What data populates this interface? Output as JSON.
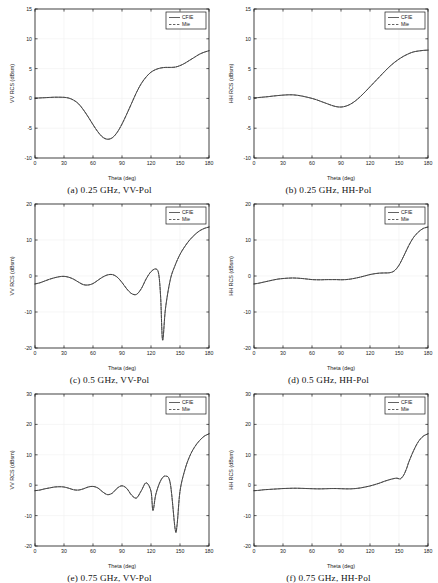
{
  "figure": {
    "panel_count": 6,
    "legend": {
      "entries": [
        "CFIE",
        "Mie"
      ],
      "position": "top-right"
    },
    "axis": {
      "xlabel": "Theta (deg)",
      "xticks": [
        0,
        30,
        60,
        90,
        120,
        150,
        180
      ],
      "xlim": [
        0,
        180
      ]
    },
    "colors": {
      "curve": "#3a3a3a",
      "axis": "#1a1a1a",
      "grid": "#f0f0f0",
      "background": "#ffffff"
    }
  },
  "chart_data": [
    {
      "id": "a",
      "type": "line",
      "caption": "(a)  0.25 GHz, VV-Pol",
      "frequency_ghz": 0.25,
      "polarization": "VV-Pol",
      "title": "",
      "xlabel": "Theta (deg)",
      "ylabel": "VV RCS (dBsm)",
      "xlim": [
        0,
        180
      ],
      "ylim": [
        -10,
        15
      ],
      "xticks": [
        0,
        30,
        60,
        90,
        120,
        150,
        180
      ],
      "yticks": [
        -10,
        -5,
        0,
        5,
        10,
        15
      ],
      "grid": true,
      "legend": [
        "CFIE",
        "Mie"
      ],
      "x": [
        0,
        5,
        10,
        15,
        20,
        25,
        30,
        35,
        40,
        45,
        50,
        55,
        60,
        65,
        70,
        75,
        80,
        85,
        90,
        95,
        100,
        105,
        110,
        115,
        120,
        125,
        130,
        135,
        140,
        145,
        150,
        155,
        160,
        165,
        170,
        175,
        180
      ],
      "series": [
        {
          "name": "CFIE",
          "style": "solid",
          "values": [
            0.05,
            0.08,
            0.12,
            0.16,
            0.2,
            0.2,
            0.18,
            0.05,
            -0.3,
            -0.9,
            -1.9,
            -3.1,
            -4.4,
            -5.6,
            -6.5,
            -6.85,
            -6.6,
            -5.7,
            -4.3,
            -2.6,
            -0.8,
            1.0,
            2.5,
            3.6,
            4.4,
            4.85,
            5.1,
            5.2,
            5.2,
            5.25,
            5.5,
            5.9,
            6.4,
            6.9,
            7.4,
            7.75,
            8.0
          ]
        },
        {
          "name": "Mie",
          "style": "dashed",
          "values": [
            0.05,
            0.08,
            0.12,
            0.16,
            0.2,
            0.2,
            0.18,
            0.05,
            -0.3,
            -0.9,
            -1.9,
            -3.1,
            -4.4,
            -5.6,
            -6.5,
            -6.85,
            -6.6,
            -5.7,
            -4.3,
            -2.6,
            -0.8,
            1.0,
            2.5,
            3.6,
            4.4,
            4.85,
            5.1,
            5.2,
            5.2,
            5.25,
            5.5,
            5.9,
            6.4,
            6.9,
            7.4,
            7.75,
            8.0
          ]
        }
      ]
    },
    {
      "id": "b",
      "type": "line",
      "caption": "(b)  0.25 GHz, HH-Pol",
      "frequency_ghz": 0.25,
      "polarization": "HH-Pol",
      "title": "",
      "xlabel": "Theta (deg)",
      "ylabel": "HH RCS (dBsm)",
      "xlim": [
        0,
        180
      ],
      "ylim": [
        -10,
        15
      ],
      "xticks": [
        0,
        30,
        60,
        90,
        120,
        150,
        180
      ],
      "yticks": [
        -10,
        -5,
        0,
        5,
        10,
        15
      ],
      "grid": true,
      "legend": [
        "CFIE",
        "Mie"
      ],
      "x": [
        0,
        5,
        10,
        15,
        20,
        25,
        30,
        35,
        40,
        45,
        50,
        55,
        60,
        65,
        70,
        75,
        80,
        85,
        90,
        95,
        100,
        105,
        110,
        115,
        120,
        125,
        130,
        135,
        140,
        145,
        150,
        155,
        160,
        165,
        170,
        175,
        180
      ],
      "series": [
        {
          "name": "CFIE",
          "style": "solid",
          "values": [
            0.1,
            0.15,
            0.22,
            0.3,
            0.4,
            0.48,
            0.55,
            0.6,
            0.6,
            0.52,
            0.38,
            0.2,
            0.0,
            -0.25,
            -0.55,
            -0.85,
            -1.15,
            -1.38,
            -1.45,
            -1.3,
            -0.95,
            -0.4,
            0.3,
            1.1,
            1.95,
            2.8,
            3.65,
            4.5,
            5.3,
            6.0,
            6.6,
            7.1,
            7.5,
            7.8,
            7.95,
            8.05,
            8.1
          ]
        },
        {
          "name": "Mie",
          "style": "dashed",
          "values": [
            0.1,
            0.15,
            0.22,
            0.3,
            0.4,
            0.48,
            0.55,
            0.6,
            0.6,
            0.52,
            0.38,
            0.2,
            0.0,
            -0.25,
            -0.55,
            -0.85,
            -1.15,
            -1.38,
            -1.45,
            -1.3,
            -0.95,
            -0.4,
            0.3,
            1.1,
            1.95,
            2.8,
            3.65,
            4.5,
            5.3,
            6.0,
            6.6,
            7.1,
            7.5,
            7.8,
            7.95,
            8.05,
            8.1
          ]
        }
      ]
    },
    {
      "id": "c",
      "type": "line",
      "caption": "(c)  0.5 GHz, VV-Pol",
      "frequency_ghz": 0.5,
      "polarization": "VV-Pol",
      "title": "",
      "xlabel": "Theta (deg)",
      "ylabel": "VV RCS (dBsm)",
      "xlim": [
        0,
        180
      ],
      "ylim": [
        -20,
        20
      ],
      "xticks": [
        0,
        30,
        60,
        90,
        120,
        150,
        180
      ],
      "yticks": [
        -20,
        -10,
        0,
        10,
        20
      ],
      "grid": true,
      "legend": [
        "CFIE",
        "Mie"
      ],
      "x": [
        0,
        5,
        10,
        15,
        20,
        25,
        30,
        35,
        40,
        45,
        50,
        55,
        60,
        65,
        70,
        75,
        80,
        85,
        90,
        95,
        100,
        105,
        110,
        115,
        120,
        125,
        128,
        130,
        132,
        135,
        140,
        145,
        150,
        155,
        160,
        165,
        170,
        175,
        180
      ],
      "series": [
        {
          "name": "CFIE",
          "style": "solid",
          "values": [
            -2.2,
            -1.9,
            -1.4,
            -0.9,
            -0.5,
            -0.2,
            -0.1,
            -0.35,
            -0.9,
            -1.7,
            -2.4,
            -2.5,
            -2.1,
            -1.2,
            -0.3,
            0.3,
            0.4,
            -0.3,
            -1.8,
            -3.6,
            -4.9,
            -5.1,
            -3.5,
            -0.8,
            1.2,
            1.95,
            0.5,
            -6.0,
            -17.8,
            -9.0,
            -1.0,
            3.0,
            6.0,
            8.2,
            10.0,
            11.4,
            12.5,
            13.2,
            13.6
          ]
        },
        {
          "name": "Mie",
          "style": "dashed",
          "values": [
            -2.2,
            -1.9,
            -1.4,
            -0.9,
            -0.5,
            -0.2,
            -0.1,
            -0.35,
            -0.9,
            -1.7,
            -2.4,
            -2.5,
            -2.1,
            -1.2,
            -0.3,
            0.3,
            0.4,
            -0.3,
            -1.8,
            -3.6,
            -4.9,
            -5.1,
            -3.5,
            -0.8,
            1.2,
            1.95,
            0.5,
            -6.0,
            -17.8,
            -9.0,
            -1.0,
            3.0,
            6.0,
            8.2,
            10.0,
            11.4,
            12.5,
            13.2,
            13.6
          ]
        }
      ]
    },
    {
      "id": "d",
      "type": "line",
      "caption": "(d)  0.5 GHz, HH-Pol",
      "frequency_ghz": 0.5,
      "polarization": "HH-Pol",
      "title": "",
      "xlabel": "Theta (deg)",
      "ylabel": "HH RCS (dBsm)",
      "xlim": [
        0,
        180
      ],
      "ylim": [
        -20,
        20
      ],
      "xticks": [
        0,
        30,
        60,
        90,
        120,
        150,
        180
      ],
      "yticks": [
        -20,
        -10,
        0,
        10,
        20
      ],
      "grid": true,
      "legend": [
        "CFIE",
        "Mie"
      ],
      "x": [
        0,
        5,
        10,
        15,
        20,
        25,
        30,
        35,
        40,
        45,
        50,
        55,
        60,
        65,
        70,
        75,
        80,
        85,
        90,
        95,
        100,
        105,
        110,
        115,
        120,
        125,
        130,
        135,
        140,
        145,
        150,
        155,
        160,
        165,
        170,
        175,
        180
      ],
      "series": [
        {
          "name": "CFIE",
          "style": "solid",
          "values": [
            -2.2,
            -2.0,
            -1.7,
            -1.4,
            -1.1,
            -0.85,
            -0.7,
            -0.6,
            -0.55,
            -0.6,
            -0.7,
            -0.85,
            -1.0,
            -1.05,
            -1.05,
            -1.0,
            -1.0,
            -1.0,
            -1.05,
            -1.0,
            -0.85,
            -0.6,
            -0.3,
            0.05,
            0.4,
            0.65,
            0.8,
            0.85,
            0.9,
            1.4,
            3.0,
            5.6,
            8.4,
            10.7,
            12.2,
            13.2,
            13.6
          ]
        },
        {
          "name": "Mie",
          "style": "dashed",
          "values": [
            -2.2,
            -2.0,
            -1.7,
            -1.4,
            -1.1,
            -0.85,
            -0.7,
            -0.6,
            -0.55,
            -0.6,
            -0.7,
            -0.85,
            -1.0,
            -1.05,
            -1.05,
            -1.0,
            -1.0,
            -1.0,
            -1.05,
            -1.0,
            -0.85,
            -0.6,
            -0.3,
            0.05,
            0.4,
            0.65,
            0.8,
            0.85,
            0.9,
            1.4,
            3.0,
            5.6,
            8.4,
            10.7,
            12.2,
            13.2,
            13.6
          ]
        }
      ]
    },
    {
      "id": "e",
      "type": "line",
      "caption": "(e)  0.75 GHz, VV-Pol",
      "frequency_ghz": 0.75,
      "polarization": "VV-Pol",
      "title": "",
      "xlabel": "Theta (deg)",
      "ylabel": "VV RCS (dBsm)",
      "xlim": [
        0,
        180
      ],
      "ylim": [
        -20,
        30
      ],
      "xticks": [
        0,
        30,
        60,
        90,
        120,
        150,
        180
      ],
      "yticks": [
        -20,
        -10,
        0,
        10,
        20,
        30
      ],
      "grid": true,
      "legend": [
        "CFIE",
        "Mie"
      ],
      "x": [
        0,
        5,
        10,
        15,
        20,
        25,
        30,
        35,
        40,
        45,
        50,
        55,
        60,
        65,
        70,
        75,
        80,
        85,
        90,
        95,
        100,
        105,
        110,
        115,
        120,
        122,
        125,
        130,
        135,
        140,
        145,
        147,
        150,
        155,
        160,
        165,
        170,
        175,
        180
      ],
      "series": [
        {
          "name": "CFIE",
          "style": "solid",
          "values": [
            -1.8,
            -1.6,
            -1.2,
            -0.9,
            -0.6,
            -0.5,
            -0.6,
            -1.0,
            -1.5,
            -1.6,
            -1.2,
            -0.6,
            -0.4,
            -0.9,
            -2.2,
            -3.1,
            -2.6,
            -1.0,
            -0.2,
            -1.1,
            -3.3,
            -4.2,
            -1.8,
            0.8,
            -2.0,
            -8.3,
            -3.0,
            1.5,
            3.0,
            0.5,
            -14.5,
            -13.0,
            -2.0,
            5.0,
            9.5,
            12.5,
            14.6,
            16.1,
            16.9
          ]
        },
        {
          "name": "Mie",
          "style": "dashed",
          "values": [
            -1.8,
            -1.6,
            -1.2,
            -0.9,
            -0.6,
            -0.5,
            -0.6,
            -1.0,
            -1.5,
            -1.6,
            -1.2,
            -0.6,
            -0.4,
            -0.9,
            -2.2,
            -3.1,
            -2.6,
            -1.0,
            -0.2,
            -1.1,
            -3.3,
            -4.2,
            -1.8,
            0.8,
            -2.0,
            -8.3,
            -3.0,
            1.5,
            3.0,
            0.5,
            -14.5,
            -13.0,
            -2.0,
            5.0,
            9.5,
            12.5,
            14.6,
            16.1,
            16.9
          ]
        }
      ]
    },
    {
      "id": "f",
      "type": "line",
      "caption": "(f)  0.75 GHz, HH-Pol",
      "frequency_ghz": 0.75,
      "polarization": "HH-Pol",
      "title": "",
      "xlabel": "Theta (deg)",
      "ylabel": "HH RCS (dBsm)",
      "xlim": [
        0,
        180
      ],
      "ylim": [
        -20,
        30
      ],
      "xticks": [
        0,
        30,
        60,
        90,
        120,
        150,
        180
      ],
      "yticks": [
        -20,
        -10,
        0,
        10,
        20,
        30
      ],
      "grid": true,
      "legend": [
        "CFIE",
        "Mie"
      ],
      "x": [
        0,
        5,
        10,
        15,
        20,
        25,
        30,
        35,
        40,
        45,
        50,
        55,
        60,
        65,
        70,
        75,
        80,
        85,
        90,
        95,
        100,
        105,
        110,
        115,
        120,
        125,
        130,
        135,
        140,
        145,
        148,
        150,
        152,
        155,
        158,
        160,
        165,
        170,
        175,
        180
      ],
      "series": [
        {
          "name": "CFIE",
          "style": "solid",
          "values": [
            -1.8,
            -1.7,
            -1.5,
            -1.4,
            -1.3,
            -1.2,
            -1.1,
            -1.05,
            -1.0,
            -1.0,
            -1.05,
            -1.1,
            -1.15,
            -1.2,
            -1.2,
            -1.15,
            -1.1,
            -1.1,
            -1.15,
            -1.2,
            -1.2,
            -1.1,
            -0.9,
            -0.6,
            -0.25,
            0.2,
            0.7,
            1.3,
            1.8,
            2.2,
            2.3,
            2.1,
            2.2,
            3.4,
            5.6,
            7.5,
            11.3,
            14.3,
            16.1,
            16.9
          ]
        },
        {
          "name": "Mie",
          "style": "dashed",
          "values": [
            -1.8,
            -1.7,
            -1.5,
            -1.4,
            -1.3,
            -1.2,
            -1.1,
            -1.05,
            -1.0,
            -1.0,
            -1.05,
            -1.1,
            -1.15,
            -1.2,
            -1.2,
            -1.15,
            -1.1,
            -1.1,
            -1.15,
            -1.2,
            -1.2,
            -1.1,
            -0.9,
            -0.6,
            -0.25,
            0.2,
            0.7,
            1.3,
            1.8,
            2.2,
            2.3,
            2.1,
            2.2,
            3.4,
            5.6,
            7.5,
            11.3,
            14.3,
            16.1,
            16.9
          ]
        }
      ]
    }
  ]
}
